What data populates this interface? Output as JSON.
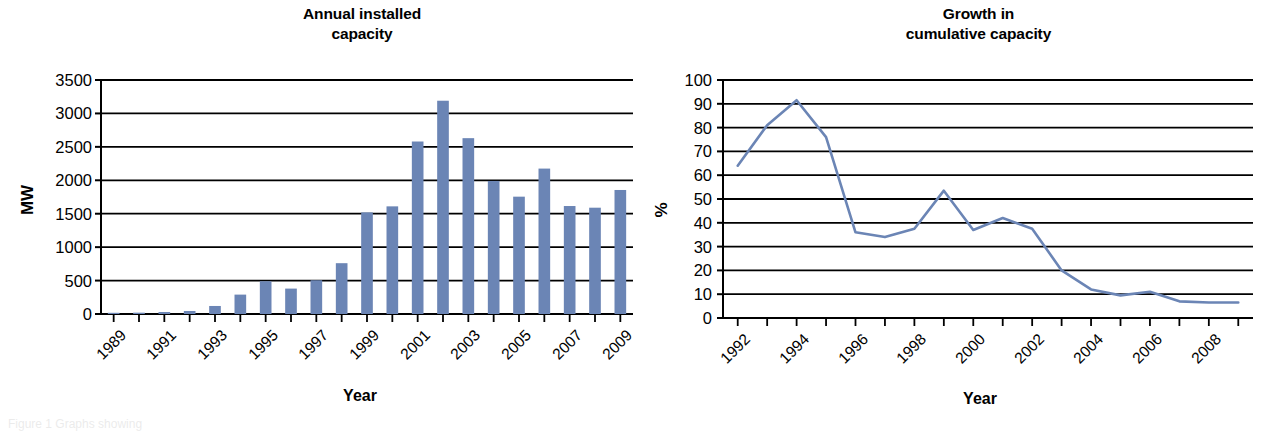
{
  "figure": {
    "background_color": "#ffffff",
    "series_color": "#6b85b5",
    "axis_color": "#000000",
    "partial_caption": "Figure 1   Graphs showing"
  },
  "charts": {
    "left": {
      "title_line1": "Annual installed",
      "title_line2": "capacity",
      "ylabel": "MW",
      "xlabel": "Year",
      "ytick_labels": [
        "3500",
        "3000",
        "2500",
        "2000",
        "1500",
        "1000",
        "500",
        "0"
      ],
      "xtick_labels": [
        "1989",
        "1991",
        "1993",
        "1995",
        "1997",
        "1999",
        "2001",
        "2003",
        "2005",
        "2007",
        "2009"
      ]
    },
    "right": {
      "title_line1": "Growth in",
      "title_line2": "cumulative capacity",
      "ylabel": "%",
      "xlabel": "Year",
      "ytick_labels": [
        "100",
        "90",
        "80",
        "70",
        "60",
        "50",
        "40",
        "30",
        "20",
        "10",
        "0"
      ],
      "xtick_labels": [
        "1992",
        "1994",
        "1996",
        "1998",
        "2000",
        "2002",
        "2004",
        "2006",
        "2008"
      ]
    }
  },
  "chart_data": [
    {
      "type": "bar",
      "title": "Annual installed capacity",
      "xlabel": "Year",
      "ylabel": "MW",
      "ylim": [
        0,
        3500
      ],
      "ytick_step": 500,
      "grid": true,
      "legend": false,
      "color": "#6b85b5",
      "categories": [
        "1989",
        "1990",
        "1991",
        "1992",
        "1993",
        "1994",
        "1995",
        "1996",
        "1997",
        "1998",
        "1999",
        "2000",
        "2001",
        "2002",
        "2003",
        "2004",
        "2005",
        "2006",
        "2007",
        "2008",
        "2009"
      ],
      "values": [
        10,
        20,
        30,
        45,
        120,
        290,
        490,
        380,
        505,
        760,
        1520,
        1610,
        2580,
        3190,
        2630,
        1990,
        1755,
        2175,
        1615,
        1590,
        1855
      ]
    },
    {
      "type": "line",
      "title": "Growth in cumulative capacity",
      "xlabel": "Year",
      "ylabel": "%",
      "ylim": [
        0,
        100
      ],
      "ytick_step": 10,
      "grid": true,
      "legend": false,
      "color": "#6b85b5",
      "x": [
        "1992",
        "1993",
        "1994",
        "1995",
        "1996",
        "1997",
        "1998",
        "1999",
        "2000",
        "2001",
        "2002",
        "2003",
        "2004",
        "2005",
        "2006",
        "2007",
        "2008",
        "2009"
      ],
      "values": [
        64,
        81,
        91.5,
        76,
        36,
        34,
        37.5,
        53.5,
        37,
        42,
        37.5,
        20,
        12,
        9.5,
        11,
        7,
        6.5,
        6.5
      ]
    }
  ]
}
